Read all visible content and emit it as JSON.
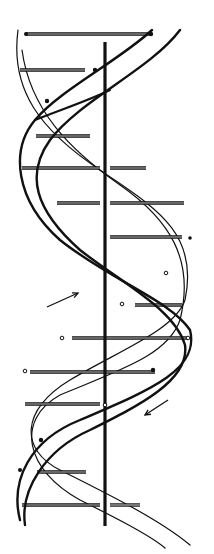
{
  "figure": {
    "colors": {
      "ink": "#111111",
      "background": "#ffffff",
      "rung_fill": "#bbbbbb"
    },
    "axis": {
      "x": 105,
      "y1": 42,
      "y2": 526
    },
    "rungs": [
      {
        "y": 34,
        "x1": 26,
        "x2": 150
      },
      {
        "y": 70,
        "x1": 20,
        "x2": 85
      },
      {
        "y": 136,
        "x1": 36,
        "x2": 90
      },
      {
        "y": 168,
        "x1": 22,
        "x2": 100
      },
      {
        "y": 168,
        "x1": 110,
        "x2": 146
      },
      {
        "y": 203,
        "x1": 57,
        "x2": 100
      },
      {
        "y": 203,
        "x1": 110,
        "x2": 184
      },
      {
        "y": 237,
        "x1": 110,
        "x2": 182
      },
      {
        "y": 305,
        "x1": 135,
        "x2": 182
      },
      {
        "y": 338,
        "x1": 72,
        "x2": 187
      },
      {
        "y": 372,
        "x1": 30,
        "x2": 155
      },
      {
        "y": 404,
        "x1": 25,
        "x2": 100
      },
      {
        "y": 472,
        "x1": 37,
        "x2": 86
      },
      {
        "y": 505,
        "x1": 22,
        "x2": 100
      },
      {
        "y": 505,
        "x1": 110,
        "x2": 140
      }
    ],
    "arrows": [
      {
        "name": "arrow-up-right",
        "x1": 47,
        "y1": 307,
        "x2": 78,
        "y2": 293
      },
      {
        "name": "arrow-down-left",
        "x1": 168,
        "y1": 400,
        "x2": 145,
        "y2": 415
      }
    ]
  }
}
